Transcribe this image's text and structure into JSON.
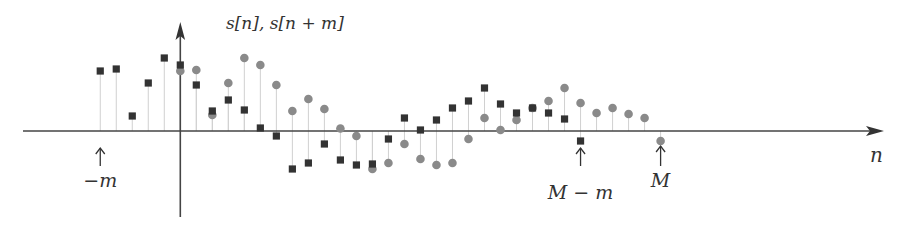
{
  "figure": {
    "y_axis_label": "s[n], s[n + m]",
    "x_axis_label": "n",
    "markers": [
      {
        "label": "−m",
        "n": -5
      },
      {
        "label": "M − m",
        "n": 25
      },
      {
        "label": "M",
        "n": 30
      }
    ],
    "colors": {
      "axis": "#444444",
      "stem": "#d0d0d0",
      "circle": "#8a8a8a",
      "square": "#333333",
      "text": "#333333"
    }
  },
  "chart_data": {
    "type": "stem",
    "title": "",
    "xlabel": "n",
    "ylabel": "s[n], s[n + m]",
    "m": 5,
    "M": 30,
    "grid": false,
    "series": [
      {
        "name": "s[n]",
        "marker": "circle",
        "n_start": 0,
        "values": [
          6.0,
          6.1,
          1.6,
          4.8,
          7.3,
          6.6,
          4.6,
          2.0,
          3.2,
          2.2,
          0.25,
          -0.5,
          -3.8,
          -3.2,
          -1.3,
          -2.8,
          -3.4,
          -3.2,
          -0.8,
          1.3,
          0.1,
          1.1,
          2.3,
          3.0,
          4.3,
          2.8,
          1.8,
          2.3,
          1.7,
          1.3,
          -1.0
        ]
      },
      {
        "name": "s[n + m]",
        "marker": "square",
        "n_start": -5,
        "values": [
          6.0,
          6.2,
          1.5,
          4.8,
          7.3,
          6.6,
          4.6,
          2.0,
          3.1,
          2.1,
          0.3,
          -0.5,
          -3.8,
          -3.2,
          -1.3,
          -2.9,
          -3.4,
          -3.3,
          -0.8,
          1.3,
          0.1,
          1.1,
          2.3,
          3.0,
          4.3,
          2.7,
          1.8,
          2.3,
          1.8,
          1.2,
          -1.0
        ]
      }
    ],
    "annotations": [
      {
        "text": "−m",
        "n": -5
      },
      {
        "text": "M − m",
        "n": 25
      },
      {
        "text": "M",
        "n": 30
      }
    ]
  }
}
